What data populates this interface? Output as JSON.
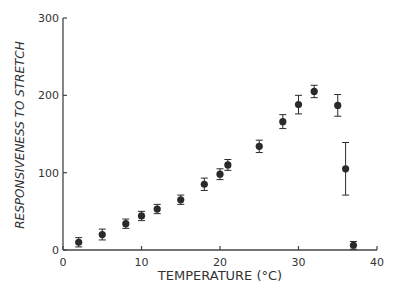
{
  "chart_data": {
    "type": "scatter",
    "title": "",
    "xlabel": "TEMPERATURE (°C)",
    "ylabel": "RESPONSIVENESS TO STRETCH",
    "xlim": [
      0,
      40
    ],
    "ylim": [
      0,
      300
    ],
    "xticks": [
      0,
      10,
      20,
      30,
      40
    ],
    "yticks": [
      0,
      100,
      200,
      300
    ],
    "grid": false,
    "legend": null,
    "series": [
      {
        "name": "responsiveness",
        "x": [
          2,
          5,
          8,
          10,
          12,
          15,
          18,
          20,
          21,
          25,
          28,
          30,
          32,
          35,
          36,
          37
        ],
        "y": [
          10,
          20,
          34,
          44,
          53,
          65,
          85,
          98,
          110,
          134,
          166,
          188,
          205,
          187,
          105,
          6
        ],
        "err": [
          6,
          7,
          6,
          6,
          6,
          6,
          8,
          7,
          7,
          8,
          9,
          12,
          8,
          14,
          34,
          5
        ]
      }
    ]
  },
  "colors": {
    "ink": "#2a2a2a",
    "axis": "#444444",
    "background": "#ffffff"
  }
}
